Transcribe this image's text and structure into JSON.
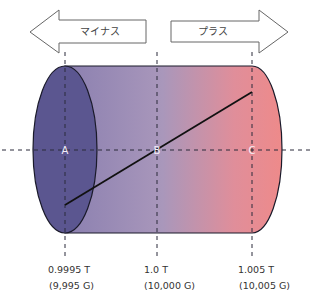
{
  "arrows": {
    "minus": {
      "label": "マイナス",
      "direction": "left"
    },
    "plus": {
      "label": "プラス",
      "direction": "right"
    }
  },
  "points": [
    {
      "id": "A",
      "label": "A"
    },
    {
      "id": "B",
      "label": "B"
    },
    {
      "id": "C",
      "label": "C"
    }
  ],
  "field_labels": [
    {
      "tesla": "0.9995 T",
      "gauss": "(9,995 G)"
    },
    {
      "tesla": "1.0 T",
      "gauss": "(10,000 G)"
    },
    {
      "tesla": "1.005 T",
      "gauss": "(10,005 G)"
    }
  ],
  "colors": {
    "gradient_start": "#5a5591",
    "gradient_mid": "#a693b8",
    "gradient_end": "#ec8b8c",
    "left_face": "#5b5690",
    "outline": "#1a1a2a"
  }
}
